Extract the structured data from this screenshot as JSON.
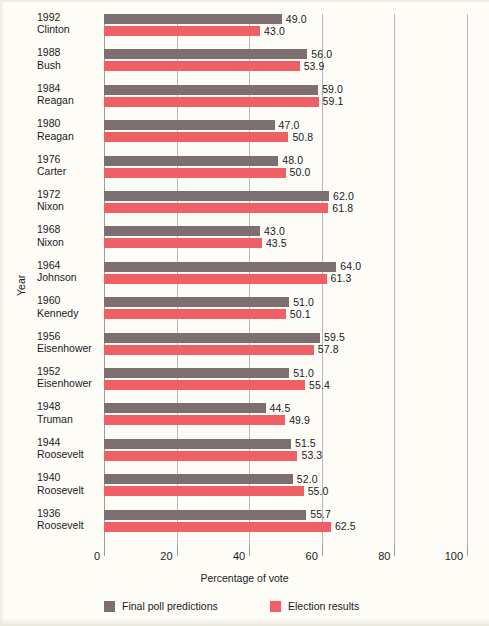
{
  "chart_data": {
    "type": "bar",
    "orientation": "horizontal",
    "title": "",
    "xlabel": "Percentage of vote",
    "ylabel": "Year",
    "xlim": [
      0,
      100
    ],
    "xticks": [
      0,
      20,
      40,
      60,
      80,
      100
    ],
    "grid": true,
    "grid_axis": "x",
    "legend_position": "bottom",
    "categories": [
      "1992 Clinton",
      "1988 Bush",
      "1984 Reagan",
      "1980 Reagan",
      "1976 Carter",
      "1972 Nixon",
      "1968 Nixon",
      "1964 Johnson",
      "1960 Kennedy",
      "1956 Eisenhower",
      "1952 Eisenhower",
      "1948 Truman",
      "1944 Roosevelt",
      "1940 Roosevelt",
      "1936 Roosevelt"
    ],
    "category_parts": [
      {
        "year": "1992",
        "president": "Clinton"
      },
      {
        "year": "1988",
        "president": "Bush"
      },
      {
        "year": "1984",
        "president": "Reagan"
      },
      {
        "year": "1980",
        "president": "Reagan"
      },
      {
        "year": "1976",
        "president": "Carter"
      },
      {
        "year": "1972",
        "president": "Nixon"
      },
      {
        "year": "1968",
        "president": "Nixon"
      },
      {
        "year": "1964",
        "president": "Johnson"
      },
      {
        "year": "1960",
        "president": "Kennedy"
      },
      {
        "year": "1956",
        "president": "Eisenhower"
      },
      {
        "year": "1952",
        "president": "Eisenhower"
      },
      {
        "year": "1948",
        "president": "Truman"
      },
      {
        "year": "1944",
        "president": "Roosevelt"
      },
      {
        "year": "1940",
        "president": "Roosevelt"
      },
      {
        "year": "1936",
        "president": "Roosevelt"
      }
    ],
    "series": [
      {
        "name": "Final poll predictions",
        "color": "#7d6e70",
        "values": [
          49.0,
          56.0,
          59.0,
          47.0,
          48.0,
          62.0,
          43.0,
          64.0,
          51.0,
          59.5,
          51.0,
          44.5,
          51.5,
          52.0,
          55.7
        ],
        "labels": [
          "49.0",
          "56.0",
          "59.0",
          "47.0",
          "48.0",
          "62.0",
          "43.0",
          "64.0",
          "51.0",
          "59.5",
          "51.0",
          "44.5",
          "51.5",
          "52.0",
          "55.7"
        ]
      },
      {
        "name": "Election results",
        "color": "#ef5f66",
        "values": [
          43.0,
          53.9,
          59.1,
          50.8,
          50.0,
          61.8,
          43.5,
          61.3,
          50.1,
          57.8,
          55.4,
          49.9,
          53.3,
          55.0,
          62.5
        ],
        "labels": [
          "43.0",
          "53.9",
          "59.1",
          "50.8",
          "50.0",
          "61.8",
          "43.5",
          "61.3",
          "50.1",
          "57.8",
          "55.4",
          "49.9",
          "53.3",
          "55.0",
          "62.5"
        ]
      }
    ],
    "legend": [
      {
        "label": "Final poll predictions",
        "color": "#7d6e70"
      },
      {
        "label": "Election results",
        "color": "#ef5f66"
      }
    ]
  }
}
